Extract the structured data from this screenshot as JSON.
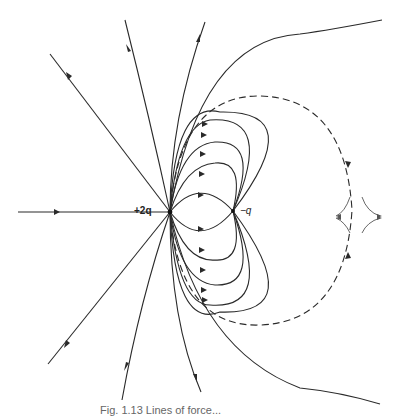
{
  "figure": {
    "type": "electric field lines diagram",
    "charges": [
      {
        "label": "+2q",
        "x": 170,
        "y": 212,
        "sign": "positive"
      },
      {
        "label": "−q",
        "x": 233,
        "y": 211,
        "sign": "negative"
      }
    ],
    "neutral_point": {
      "x": 352,
      "y": 210
    },
    "separatrix_style": "dashed",
    "caption": "Fig. 1.13 Lines of force..."
  }
}
